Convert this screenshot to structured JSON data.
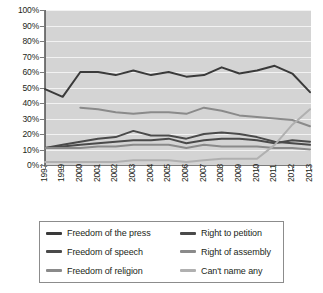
{
  "chart_data": {
    "type": "line",
    "title": "",
    "xlabel": "",
    "ylabel": "",
    "ylim": [
      0,
      100
    ],
    "y_tick_step": 10,
    "grid": true,
    "legend_position": "bottom",
    "y_ticks": [
      "0%",
      "10%",
      "20%",
      "30%",
      "40%",
      "50%",
      "60%",
      "70%",
      "80%",
      "90%",
      "100%"
    ],
    "categories": [
      "1997",
      "1999",
      "2000",
      "2001",
      "2002",
      "2003",
      "2004",
      "2005",
      "2006",
      "2007",
      "2008",
      "2009",
      "2010",
      "2011",
      "2012",
      "2013"
    ],
    "series": [
      {
        "name": "Freedom of the press",
        "color": "#3a3a3a",
        "values": [
          49,
          44,
          60,
          60,
          58,
          61,
          58,
          60,
          57,
          58,
          63,
          59,
          61,
          64,
          59,
          47
        ]
      },
      {
        "name": "Freedom of speech",
        "color": "#4a4a4a",
        "values": [
          11,
          12,
          13,
          14,
          15,
          16,
          16,
          17,
          14,
          16,
          17,
          17,
          16,
          14,
          16,
          15
        ]
      },
      {
        "name": "Freedom of religion",
        "color": "#8a8a8a",
        "values": [
          null,
          null,
          37,
          36,
          34,
          33,
          34,
          34,
          33,
          37,
          35,
          32,
          31,
          30,
          29,
          25
        ]
      },
      {
        "name": "Right to petition",
        "color": "#4a4a4a",
        "values": [
          11,
          13,
          15,
          17,
          18,
          22,
          19,
          19,
          17,
          20,
          21,
          20,
          18,
          15,
          14,
          13
        ]
      },
      {
        "name": "Right of assembly",
        "color": "#8a8a8a",
        "values": [
          11,
          11,
          11,
          12,
          12,
          13,
          13,
          13,
          11,
          13,
          12,
          12,
          12,
          11,
          11,
          10
        ]
      },
      {
        "name": "Can't name any",
        "color": "#b0b0b0",
        "values": [
          2,
          2,
          2,
          2,
          2,
          3,
          3,
          3,
          2,
          3,
          4,
          4,
          4,
          13,
          26,
          36
        ]
      }
    ]
  },
  "legend": {
    "items": [
      {
        "label": "Freedom of the press",
        "color": "#3a3a3a"
      },
      {
        "label": "Right to petition",
        "color": "#4a4a4a"
      },
      {
        "label": "Freedom of speech",
        "color": "#4a4a4a"
      },
      {
        "label": "Right of assembly",
        "color": "#8a8a8a"
      },
      {
        "label": "Freedom of religion",
        "color": "#8a8a8a"
      },
      {
        "label": "Can't name any",
        "color": "#b0b0b0"
      }
    ]
  },
  "style": {
    "plot_background": "#d4d4d4",
    "gridline_color": "#f2f2f2",
    "axis_color": "#7a7a7a",
    "text_color": "#231f20",
    "page_background": "#ffffff"
  }
}
